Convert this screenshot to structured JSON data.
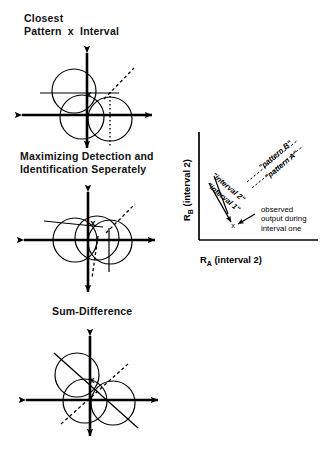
{
  "figure": {
    "background_color": "#ffffff",
    "ink_color": "#000000",
    "panels": [
      {
        "id": "closest-pattern-x-interval",
        "heading": "Closest\nPattern  x  Interval",
        "marker_label": "x",
        "description": "three overlapping circles on a cartesian axis with a dashed diagonal decision line, a solid horizontal chord line and a dotted vertical line"
      },
      {
        "id": "maximizing-detection-identification",
        "heading": "Maximizing Detection and\nIdentification Seperately",
        "marker_label": "x",
        "description": "overlapping circles on a cartesian axis with a dashed diagonal line, a solid tilted line and a dashed vertical line"
      },
      {
        "id": "sum-difference",
        "heading": "Sum-Difference",
        "marker_label": "x",
        "description": "three overlapping circles on a cartesian axis crossed by a solid down-right diagonal and a dashed up-right diagonal"
      }
    ]
  },
  "right_plot": {
    "y_axis_label": "R",
    "y_axis_subscript": "B",
    "y_axis_suffix": " (interval 2)",
    "x_axis_label": "R",
    "x_axis_subscript": "A",
    "x_axis_suffix": " (interval 2)",
    "pattern_b_label": "\"pattern B\"",
    "pattern_a_label": "\"pattern A\"",
    "interval_2_label": "\"interval 2\"",
    "interval_1_label": "\"interval 1\"",
    "marker_label": "x",
    "annotation": "observed\noutput during\ninterval one"
  }
}
